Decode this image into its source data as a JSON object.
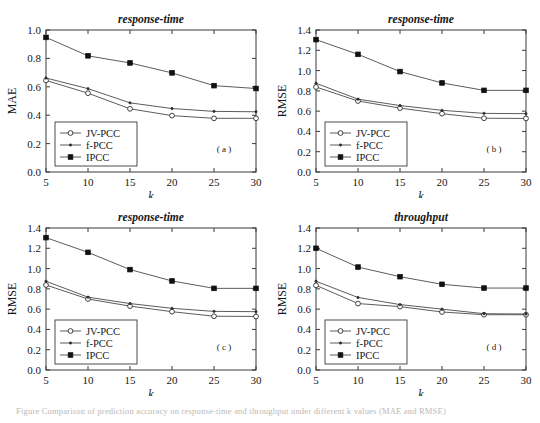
{
  "figure": {
    "caption": "Figure  Comparison of prediction accuracy on response-time and throughput under different k values (MAE and RMSE)",
    "panels_order": [
      "a",
      "b",
      "c",
      "d"
    ]
  },
  "legend": {
    "entries": [
      {
        "label": "JV-PCC",
        "marker": "open-circle-icon"
      },
      {
        "label": "f-PCC",
        "marker": "small-dot-icon"
      },
      {
        "label": "IPCC",
        "marker": "filled-square-icon"
      }
    ]
  },
  "chart_data": [
    {
      "type": "line",
      "panel": "a",
      "tag": "( a )",
      "title": "response-time",
      "xlabel": "k",
      "ylabel": "MAE",
      "x": [
        5,
        10,
        15,
        20,
        25,
        30
      ],
      "xticks": [
        5,
        10,
        15,
        20,
        25,
        30
      ],
      "yticks": [
        0.0,
        0.2,
        0.4,
        0.6,
        0.8,
        1.0
      ],
      "xlim": [
        5,
        30
      ],
      "ylim": [
        0.0,
        1.0
      ],
      "grid": false,
      "legend_position": "lower-left",
      "series": [
        {
          "name": "JV-PCC",
          "marker": "open-circle",
          "values": [
            0.645,
            0.555,
            0.445,
            0.397,
            0.378,
            0.378
          ]
        },
        {
          "name": "f-PCC",
          "marker": "small-dot",
          "values": [
            0.662,
            0.587,
            0.487,
            0.447,
            0.427,
            0.424
          ]
        },
        {
          "name": "IPCC",
          "marker": "filled-square",
          "values": [
            0.948,
            0.818,
            0.768,
            0.698,
            0.608,
            0.588
          ]
        }
      ]
    },
    {
      "type": "line",
      "panel": "b",
      "tag": "( b )",
      "title": "response-time",
      "xlabel": "k",
      "ylabel": "RMSE",
      "x": [
        5,
        10,
        15,
        20,
        25,
        30
      ],
      "xticks": [
        5,
        10,
        15,
        20,
        25,
        30
      ],
      "yticks": [
        0.0,
        0.2,
        0.4,
        0.6,
        0.8,
        1.0,
        1.2,
        1.4
      ],
      "xlim": [
        5,
        30
      ],
      "ylim": [
        0.0,
        1.4
      ],
      "grid": false,
      "legend_position": "lower-left",
      "series": [
        {
          "name": "JV-PCC",
          "marker": "open-circle",
          "values": [
            0.838,
            0.7,
            0.63,
            0.575,
            0.53,
            0.528
          ]
        },
        {
          "name": "f-PCC",
          "marker": "small-dot",
          "values": [
            0.875,
            0.718,
            0.655,
            0.608,
            0.578,
            0.575
          ]
        },
        {
          "name": "IPCC",
          "marker": "filled-square",
          "values": [
            1.305,
            1.16,
            0.99,
            0.878,
            0.805,
            0.805
          ]
        }
      ]
    },
    {
      "type": "line",
      "panel": "c",
      "tag": "( c )",
      "title": "response-time",
      "xlabel": "k",
      "ylabel": "RMSE",
      "x": [
        5,
        10,
        15,
        20,
        25,
        30
      ],
      "xticks": [
        5,
        10,
        15,
        20,
        25,
        30
      ],
      "yticks": [
        0.0,
        0.2,
        0.4,
        0.6,
        0.8,
        1.0,
        1.2,
        1.4
      ],
      "xlim": [
        5,
        30
      ],
      "ylim": [
        0.0,
        1.4
      ],
      "grid": false,
      "legend_position": "lower-left",
      "series": [
        {
          "name": "JV-PCC",
          "marker": "open-circle",
          "values": [
            0.838,
            0.7,
            0.63,
            0.575,
            0.53,
            0.528
          ]
        },
        {
          "name": "f-PCC",
          "marker": "small-dot",
          "values": [
            0.875,
            0.718,
            0.655,
            0.608,
            0.578,
            0.575
          ]
        },
        {
          "name": "IPCC",
          "marker": "filled-square",
          "values": [
            1.305,
            1.16,
            0.99,
            0.878,
            0.805,
            0.805
          ]
        }
      ]
    },
    {
      "type": "line",
      "panel": "d",
      "tag": "( d )",
      "title": "throughput",
      "xlabel": "k",
      "ylabel": "RMSE",
      "x": [
        5,
        10,
        15,
        20,
        25,
        30
      ],
      "xticks": [
        5,
        10,
        15,
        20,
        25,
        30
      ],
      "yticks": [
        0.0,
        0.2,
        0.4,
        0.6,
        0.8,
        1.0,
        1.2,
        1.4
      ],
      "xlim": [
        5,
        30
      ],
      "ylim": [
        0.0,
        1.4
      ],
      "grid": false,
      "legend_position": "lower-left",
      "series": [
        {
          "name": "JV-PCC",
          "marker": "open-circle",
          "values": [
            0.835,
            0.655,
            0.625,
            0.572,
            0.545,
            0.545
          ]
        },
        {
          "name": "f-PCC",
          "marker": "small-dot",
          "values": [
            0.875,
            0.715,
            0.645,
            0.6,
            0.555,
            0.552
          ]
        },
        {
          "name": "IPCC",
          "marker": "filled-square",
          "values": [
            1.2,
            1.015,
            0.92,
            0.845,
            0.808,
            0.808
          ]
        }
      ]
    }
  ]
}
